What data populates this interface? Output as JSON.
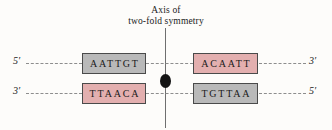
{
  "figure": {
    "title_line1": "Axis of",
    "title_line2": "two-fold symmetry",
    "axis_marker_name": "dyad",
    "colors": {
      "background": "#fdfcfa",
      "gray_box": "#b9b9b9",
      "pink_box": "#e3afaf",
      "box_border": "#4a4a4a",
      "backbone_line": "#8d8d8d",
      "axis_line": "#6f6f6f",
      "dyad_marker": "#141414",
      "text": "#1a1a1a"
    }
  },
  "strands": {
    "top": {
      "left_end_label": "5′",
      "right_end_label": "3′",
      "left_box": {
        "sequence": "AATTGT",
        "color": "gray"
      },
      "right_box": {
        "sequence": "ACAATT",
        "color": "pink"
      }
    },
    "bottom": {
      "left_end_label": "3′",
      "right_end_label": "5′",
      "left_box": {
        "sequence": "TTAACA",
        "color": "pink"
      },
      "right_box": {
        "sequence": "TGTTAA",
        "color": "gray"
      }
    }
  }
}
